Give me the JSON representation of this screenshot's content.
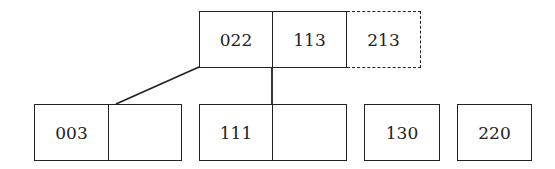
{
  "diagram": {
    "type": "tree",
    "root": {
      "keys": [
        "022",
        "113",
        "213"
      ],
      "dashed_key_index": 2
    },
    "children": [
      {
        "keys": [
          "003",
          ""
        ]
      },
      {
        "keys": [
          "111",
          ""
        ]
      },
      {
        "keys": [
          "130"
        ]
      },
      {
        "keys": [
          "220"
        ]
      }
    ],
    "edges": [
      {
        "from": "root",
        "to": "child-0"
      },
      {
        "from": "root",
        "to": "child-1"
      }
    ]
  }
}
